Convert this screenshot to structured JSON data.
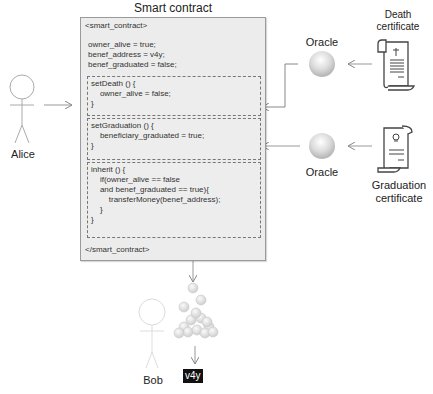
{
  "diagram": {
    "title": "Smart contract",
    "contract": {
      "open_tag": "<smart_contract>",
      "close_tag": "</smart_contract>",
      "state": [
        "owner_alive = true;",
        "benef_address = v4y;",
        "benef_graduated = false;"
      ],
      "functions": [
        {
          "name": "setDeath",
          "lines": [
            "setDeath () {",
            "    owner_alive = false;",
            "}"
          ]
        },
        {
          "name": "setGraduation",
          "lines": [
            "setGraduation () {",
            "    beneficiary_graduated = true;",
            "}"
          ]
        },
        {
          "name": "inherit",
          "lines": [
            "inherit () {",
            "    if(owner_alive == false",
            "    and benef_graduated == true){",
            "        transferMoney(benef_address);",
            "    }",
            "}"
          ]
        }
      ]
    },
    "actors": {
      "alice": "Alice",
      "bob": "Bob"
    },
    "oracles": {
      "top": "Oracle",
      "bottom": "Oracle"
    },
    "documents": {
      "death": "Death\ncertificate",
      "graduation": "Graduation\ncertificate"
    },
    "address_badge": "v4y"
  }
}
